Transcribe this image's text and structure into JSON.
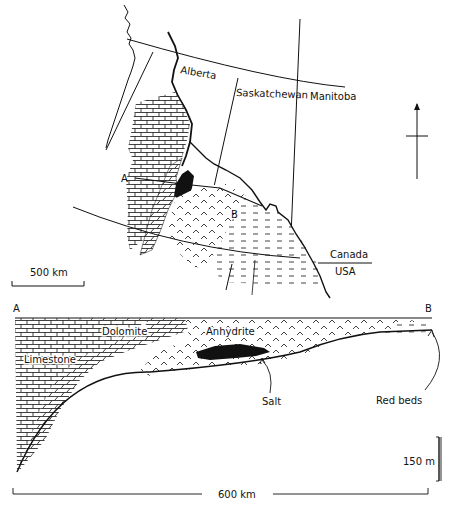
{
  "map": {
    "provinces": [
      "Alberta",
      "Saskatchewan",
      "Manitoba"
    ],
    "country_labels": {
      "north": "Canada",
      "south": "USA"
    },
    "section_endpoints": {
      "start": "A",
      "end": "B"
    },
    "scale_bar": "500 km",
    "north_arrow": "north-arrow"
  },
  "cross_section": {
    "endpoint_left": "A",
    "endpoint_right": "B",
    "units": {
      "dolomite": "Dolomite",
      "anhydrite": "Anhydrite",
      "limestone": "Limestone",
      "salt": "Salt",
      "red_beds": "Red beds"
    },
    "vertical_scale": "150 m",
    "horizontal_scale": "600 km"
  }
}
